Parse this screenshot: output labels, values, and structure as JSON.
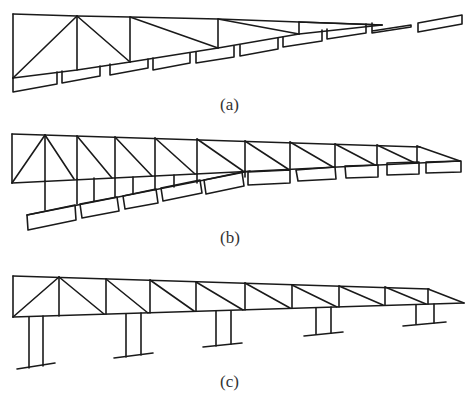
{
  "figure": {
    "panels": [
      {
        "id": "a",
        "label": "(a)",
        "description": "Truss with cantilevered bottom slabs, decreasing depth"
      },
      {
        "id": "b",
        "label": "(b)",
        "description": "Truss with suspended slabs on hangers"
      },
      {
        "id": "c",
        "label": "(c)",
        "description": "Truss supported on piers"
      }
    ],
    "colors": {
      "line": "#1a1a1a",
      "label": "#333333",
      "background": "#ffffff"
    }
  }
}
